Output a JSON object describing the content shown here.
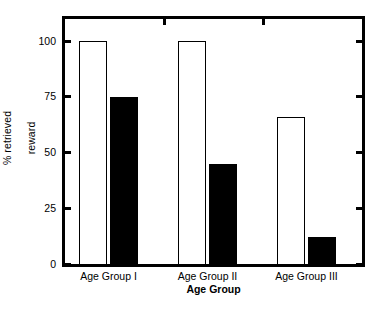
{
  "chart_data": {
    "type": "bar",
    "title": "",
    "subtitle": "",
    "xlabel": "Age Group",
    "ylabel": "% retrieved\nreward",
    "ylabel_line1": "% retrieved",
    "ylabel_line2": "reward",
    "categories": [
      "Age Group I",
      "Age Group II",
      "Age Group III"
    ],
    "series": [
      {
        "name": "open",
        "style": "white-bar-black-outline",
        "color": "#ffffff",
        "edge_color": "#000000",
        "values": [
          100,
          100,
          66
        ]
      },
      {
        "name": "filled",
        "style": "solid-black-bar",
        "color": "#000000",
        "edge_color": "#000000",
        "values": [
          75,
          45,
          12
        ]
      }
    ],
    "ylim": [
      0,
      110
    ],
    "yticks": [
      0,
      25,
      50,
      75,
      100
    ],
    "ytick_labels": [
      "0",
      "25",
      "50",
      "75",
      "100"
    ],
    "grid": false,
    "legend": false,
    "frame": "box",
    "tick_direction": "out",
    "axis_color": "#000000",
    "background": "#ffffff"
  },
  "axes": {
    "y_ticks": [
      {
        "label": "100",
        "value": 100
      },
      {
        "label": "75",
        "value": 75
      },
      {
        "label": "50",
        "value": 50
      },
      {
        "label": "25",
        "value": 25
      },
      {
        "label": "0",
        "value": 0
      }
    ],
    "x_title": "Age Group",
    "y_title_line1": "% retrieved",
    "y_title_line2": "reward"
  }
}
